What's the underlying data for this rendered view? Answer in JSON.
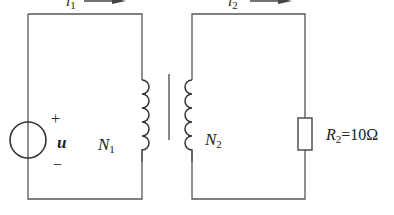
{
  "diagram": {
    "type": "circuit",
    "source": {
      "symbol": "u",
      "plus": "+",
      "minus": "−"
    },
    "currents": [
      {
        "name": "i",
        "sub": "1",
        "direction": "right"
      },
      {
        "name": "i",
        "sub": "2",
        "direction": "right"
      }
    ],
    "primary_winding": {
      "name": "N",
      "sub": "1"
    },
    "secondary_winding": {
      "name": "N",
      "sub": "2"
    },
    "load": {
      "name": "R",
      "sub": "2",
      "value": "=10Ω"
    },
    "colors": {
      "line": "#555555",
      "text": "#222222",
      "background": "#ffffff"
    }
  }
}
